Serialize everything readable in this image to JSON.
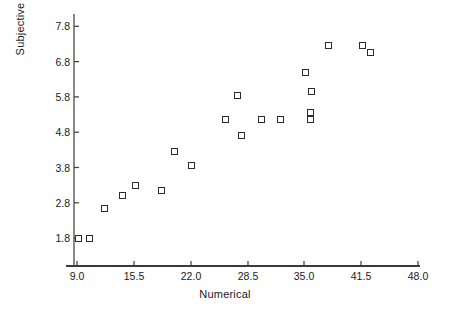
{
  "chart_data": {
    "type": "scatter",
    "title": "",
    "xlabel": "Numerical",
    "ylabel": "Subjective",
    "xlim": [
      7.0,
      48.0
    ],
    "ylim": [
      1.2,
      8.2
    ],
    "grid": false,
    "legend": null,
    "xticks": [
      9.0,
      15.5,
      22.0,
      28.5,
      35.0,
      41.5,
      48.0
    ],
    "xticklabels": [
      "9.0",
      "15.5",
      "22.0",
      "28.5",
      "35.0",
      "41.5",
      "48.0"
    ],
    "yticks": [
      1.8,
      2.8,
      3.8,
      4.8,
      5.8,
      6.8,
      7.8
    ],
    "yticklabels": [
      "1.8",
      "2.8",
      "3.8",
      "4.8",
      "5.8",
      "6.8",
      "7.8"
    ],
    "marker": "open-square",
    "marker_color": "#2b2b2b",
    "points": [
      {
        "x": 9.2,
        "y": 1.8
      },
      {
        "x": 10.4,
        "y": 1.8
      },
      {
        "x": 12.1,
        "y": 2.65
      },
      {
        "x": 14.2,
        "y": 3.0
      },
      {
        "x": 15.7,
        "y": 3.3
      },
      {
        "x": 18.7,
        "y": 3.15
      },
      {
        "x": 20.2,
        "y": 4.25
      },
      {
        "x": 22.1,
        "y": 3.85
      },
      {
        "x": 26.0,
        "y": 5.15
      },
      {
        "x": 27.3,
        "y": 5.85
      },
      {
        "x": 27.8,
        "y": 4.72
      },
      {
        "x": 30.1,
        "y": 5.15
      },
      {
        "x": 32.3,
        "y": 5.15
      },
      {
        "x": 35.1,
        "y": 6.5
      },
      {
        "x": 35.8,
        "y": 5.95
      },
      {
        "x": 35.7,
        "y": 5.35
      },
      {
        "x": 35.7,
        "y": 5.15
      },
      {
        "x": 37.8,
        "y": 7.25
      },
      {
        "x": 41.6,
        "y": 7.25
      },
      {
        "x": 42.6,
        "y": 7.05
      }
    ]
  },
  "axis": {
    "x_title": "Numerical",
    "y_title": "Subjective"
  }
}
